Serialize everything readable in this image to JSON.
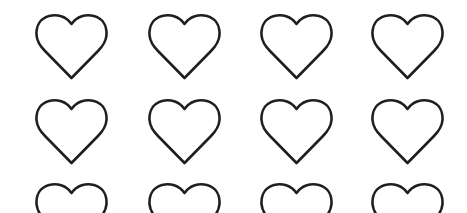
{
  "pattern": {
    "icon": "heart-outline-icon",
    "stroke_color": "#1f1f1f",
    "background_color": "#ffffff",
    "columns": 4,
    "rows_visible": 3,
    "column_centers_x": [
      71,
      184,
      296,
      407
    ],
    "row_tops_y": [
      15,
      100,
      184
    ],
    "heart_size": {
      "width": 73,
      "height": 67
    }
  }
}
